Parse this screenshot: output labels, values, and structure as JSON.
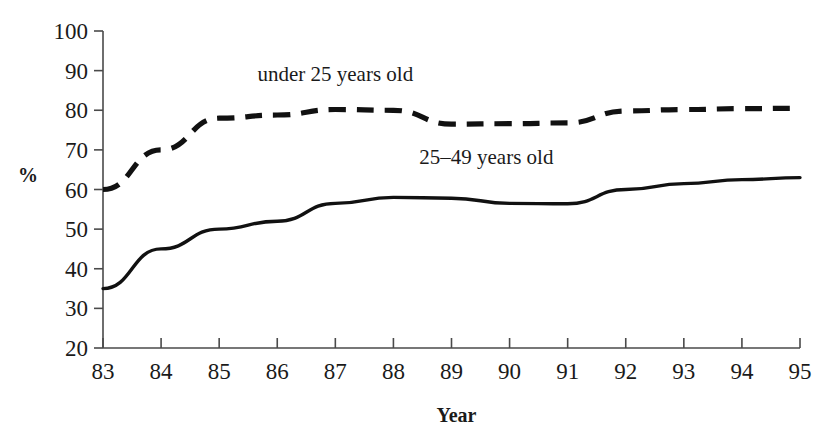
{
  "chart_data": {
    "type": "line",
    "title": "",
    "subtitle": "",
    "xlabel": "Year",
    "ylabel": "%",
    "x": [
      83,
      84,
      85,
      86,
      87,
      88,
      89,
      90,
      91,
      92,
      93,
      94,
      95
    ],
    "xtick_labels": [
      "83",
      "84",
      "85",
      "86",
      "87",
      "88",
      "89",
      "90",
      "91",
      "92",
      "93",
      "94",
      "95"
    ],
    "ytick_labels": [
      "20",
      "30",
      "40",
      "50",
      "60",
      "70",
      "80",
      "90",
      "100"
    ],
    "yticks": [
      20,
      30,
      40,
      50,
      60,
      70,
      80,
      90,
      100
    ],
    "xlim": [
      83,
      95
    ],
    "ylim": [
      20,
      100
    ],
    "grid": false,
    "legend_position": "inline-annotation",
    "series": [
      {
        "name": "under 25 years old",
        "style": "dashed",
        "color": "#111111",
        "label_x": 87.0,
        "label_y": 87.5,
        "values": [
          60.0,
          70.0,
          78.0,
          78.8,
          80.2,
          80.0,
          76.5,
          76.6,
          76.8,
          79.8,
          80.2,
          80.4,
          80.5
        ]
      },
      {
        "name": "25–49 years old",
        "style": "solid",
        "color": "#111111",
        "label_x": 89.6,
        "label_y": 66.5,
        "values": [
          35.0,
          45.0,
          50.0,
          52.0,
          56.5,
          58.0,
          57.8,
          56.5,
          56.4,
          60.0,
          61.5,
          62.5,
          63.0
        ]
      }
    ],
    "annotations": [
      {
        "text": "under 25 years old"
      },
      {
        "text": "25–49 years old"
      }
    ]
  },
  "axes": {
    "y_axis_title": "%",
    "x_axis_title": "Year"
  }
}
